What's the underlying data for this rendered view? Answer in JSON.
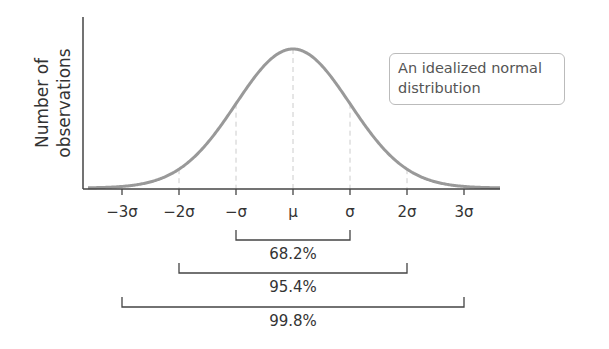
{
  "chart_data": {
    "type": "line",
    "title": "",
    "xlabel": "",
    "ylabel": "Number of observations",
    "ylabel_lines": [
      "Number of",
      "observations"
    ],
    "legend": "An idealized normal distribution",
    "legend_lines": [
      "An idealized normal",
      "distribution"
    ],
    "x_ticks": [
      "-3σ",
      "-2σ",
      "-σ",
      "μ",
      "σ",
      "2σ",
      "3σ"
    ],
    "x_tick_values": [
      -3,
      -2,
      -1,
      0,
      1,
      2,
      3
    ],
    "xlim": [
      -3.7,
      3.7
    ],
    "grid": false,
    "curve": "standard normal density",
    "dashed_guides_at": [
      -2,
      -1,
      0,
      1,
      2
    ],
    "intervals": [
      {
        "range": [
          -1,
          1
        ],
        "label": "68.2%",
        "value": 68.2
      },
      {
        "range": [
          -2,
          2
        ],
        "label": "95.4%",
        "value": 95.4
      },
      {
        "range": [
          -3,
          3
        ],
        "label": "99.8%",
        "value": 99.8
      }
    ],
    "colors": {
      "curve": "#999999",
      "axis": "#444444",
      "text": "#333333",
      "legend_border": "#bbbbbb"
    }
  }
}
